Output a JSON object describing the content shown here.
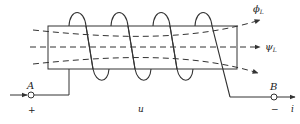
{
  "diagram": {
    "colors": {
      "stroke": "#333333",
      "background": "#ffffff"
    },
    "labels": {
      "terminal_a": "A",
      "terminal_b": "B",
      "plus": "+",
      "minus": "−",
      "voltage": "u",
      "current": "i",
      "flux_phi": "ϕ",
      "flux_phi_sub": "L",
      "flux_psi": "ψ",
      "flux_psi_sub": "L"
    },
    "coil_turns": 4
  }
}
